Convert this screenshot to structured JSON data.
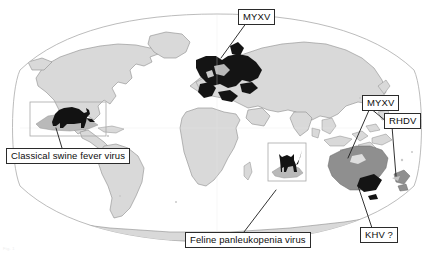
{
  "figure": {
    "type": "world-map-distribution",
    "projection": "robinson",
    "background_color": "#ffffff",
    "land_color": "#d9d9d9",
    "land_outline_color": "#8d8d8d",
    "ocean_color": "#ffffff",
    "highlight_black": "#121212",
    "highlight_darkgray": "#8f8f8f",
    "inset_box_color": "#f2f2f2",
    "inset_border_color": "#a8a8a8",
    "leader_line_color": "#1b1b1b",
    "label_border_color": "#2b2b2b",
    "label_text_color": "#0d0d0d",
    "credit_text": "Fig. 1"
  },
  "callouts": {
    "myxv_europe": {
      "label": "MYXV",
      "name": "myxoma-virus-europe",
      "points_to": "Western Europe / France",
      "anchor_x": 239,
      "anchor_y": 55
    },
    "myxv_australia": {
      "label": "MYXV",
      "name": "myxoma-virus-australia",
      "points_to": "Australia mainland",
      "anchor_x": 363,
      "anchor_y": 158
    },
    "rhdv": {
      "label": "RHDV",
      "name": "rabbit-haemorrhagic-disease-virus",
      "points_to": "New Zealand",
      "anchor_x": 393,
      "anchor_y": 176
    },
    "khv": {
      "label": "KHV ?",
      "name": "koi-herpesvirus",
      "points_to": "Southeast Australia",
      "anchor_x": 372,
      "anchor_y": 186
    },
    "csfv": {
      "label": "Classical swine fever virus",
      "name": "classical-swine-fever-virus",
      "points_to": "Caribbean / wild boar inset",
      "anchor_x": 60,
      "anchor_y": 127
    },
    "fpv": {
      "label": "Feline panleukopenia virus",
      "name": "feline-panleukopenia-virus",
      "points_to": "Indian Ocean island / feral cat inset",
      "anchor_x": 280,
      "anchor_y": 185
    }
  },
  "animal_insets": {
    "boar": {
      "name": "wild-boar-silhouette",
      "description": "black wild boar silhouette over shaded island inset",
      "x": 30,
      "y": 102
    },
    "cat": {
      "name": "feral-cat-silhouette",
      "description": "black feral cat silhouette over shaded island inset",
      "x": 268,
      "y": 143
    }
  },
  "highlighted_regions": [
    {
      "name": "western-europe",
      "fill": "black",
      "virus": "MYXV"
    },
    {
      "name": "australia",
      "fill": "dark-gray",
      "virus": "MYXV"
    },
    {
      "name": "southeast-australia",
      "fill": "black",
      "virus": "KHV ?"
    },
    {
      "name": "new-zealand",
      "fill": "dark-gray",
      "virus": "RHDV"
    }
  ]
}
